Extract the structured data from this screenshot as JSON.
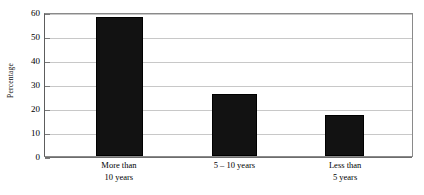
{
  "chart_data": {
    "type": "bar",
    "title": "",
    "xlabel": "",
    "ylabel": "Percentage",
    "categories": [
      "More than 10 years",
      "5 – 10 years",
      "Less than 5 years"
    ],
    "category_lines": [
      [
        "More than",
        "10 years"
      ],
      [
        "5 – 10 years"
      ],
      [
        "Less than",
        "5 years"
      ]
    ],
    "values": [
      58,
      26,
      17
    ],
    "ylim": [
      0,
      60
    ],
    "ytick_step": 10,
    "yticks": [
      0,
      10,
      20,
      30,
      40,
      50,
      60
    ],
    "ytick_labels": [
      "0",
      "10",
      "20",
      "30",
      "40",
      "50",
      "60"
    ],
    "grid": true,
    "legend": false,
    "bar_color": "#121212",
    "grid_color": "#c8c8c8",
    "axis_color": "#6d6d6d",
    "plot_background": "#ffffff",
    "bar_geometry": [
      {
        "left_pct": 13.8,
        "width_pct": 13.0
      },
      {
        "left_pct": 45.5,
        "width_pct": 12.2
      },
      {
        "left_pct": 76.2,
        "width_pct": 10.8
      }
    ],
    "label_geometry": [
      {
        "center_pct": 20.3
      },
      {
        "center_pct": 51.6
      },
      {
        "center_pct": 81.6
      }
    ]
  }
}
